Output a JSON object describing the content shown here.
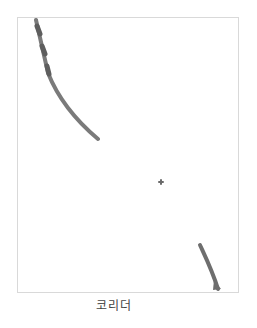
{
  "figure": {
    "caption": "코리더",
    "border_color": "#d9d9d9",
    "stroke_color": "#6e6e6e",
    "shapes": [
      {
        "name": "curved-band-top-left",
        "description": "long curved grey band from top-left edge sweeping down to the right"
      },
      {
        "name": "center-dot",
        "description": "small grey cross-shaped dot near center"
      },
      {
        "name": "short-band-bottom-right",
        "description": "short diagonal grey band at bottom-right corner"
      }
    ]
  }
}
